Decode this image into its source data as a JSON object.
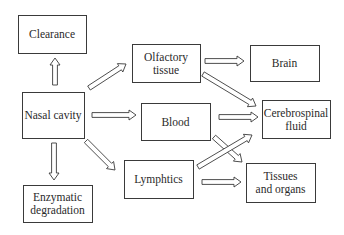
{
  "diagram": {
    "type": "flowchart",
    "nodes": [
      {
        "id": "clearance",
        "lines": [
          "Clearance"
        ]
      },
      {
        "id": "olfactory",
        "lines": [
          "Olfactory",
          "tissue"
        ]
      },
      {
        "id": "brain",
        "lines": [
          "Brain"
        ]
      },
      {
        "id": "nasal",
        "lines": [
          "Nasal cavity"
        ]
      },
      {
        "id": "blood",
        "lines": [
          "Blood"
        ]
      },
      {
        "id": "csf",
        "lines": [
          "Cerebrospinal",
          "fluid"
        ]
      },
      {
        "id": "enzymatic",
        "lines": [
          "Enzymatic",
          "degradation"
        ]
      },
      {
        "id": "lymphatics",
        "lines": [
          "Lymphtics"
        ]
      },
      {
        "id": "tissues",
        "lines": [
          "Tissues",
          "and organs"
        ]
      }
    ],
    "edges": [
      {
        "from": "nasal",
        "to": "clearance"
      },
      {
        "from": "nasal",
        "to": "olfactory"
      },
      {
        "from": "nasal",
        "to": "blood"
      },
      {
        "from": "nasal",
        "to": "enzymatic"
      },
      {
        "from": "nasal",
        "to": "lymphatics"
      },
      {
        "from": "olfactory",
        "to": "brain"
      },
      {
        "from": "olfactory",
        "to": "csf"
      },
      {
        "from": "blood",
        "to": "csf"
      },
      {
        "from": "blood",
        "to": "tissues"
      },
      {
        "from": "lymphatics",
        "to": "csf"
      },
      {
        "from": "lymphatics",
        "to": "tissues"
      }
    ]
  }
}
